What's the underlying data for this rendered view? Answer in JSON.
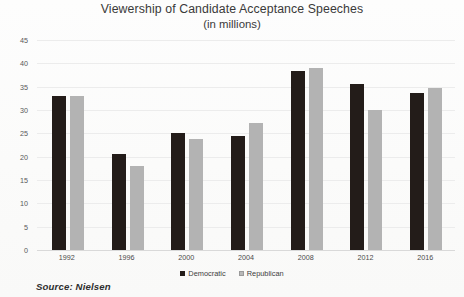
{
  "chart_data": {
    "type": "bar",
    "title": "Viewership of Candidate Acceptance Speeches",
    "subtitle": "(in millions)",
    "xlabel": "",
    "ylabel": "",
    "ylim": [
      0,
      45
    ],
    "yticks": [
      0,
      5,
      10,
      15,
      20,
      25,
      30,
      35,
      40,
      45
    ],
    "grid": true,
    "legend_position": "bottom",
    "categories": [
      "1992",
      "1996",
      "2000",
      "2004",
      "2008",
      "2012",
      "2016"
    ],
    "series": [
      {
        "name": "Democratic",
        "color": "#231c19",
        "values": [
          33.0,
          20.5,
          25.0,
          24.4,
          38.4,
          35.6,
          33.6
        ]
      },
      {
        "name": "Republican",
        "color": "#b3b3b3",
        "values": [
          33.0,
          18.1,
          23.7,
          27.2,
          38.9,
          30.0,
          34.7
        ]
      }
    ],
    "source_note": "Source: Nielsen"
  }
}
